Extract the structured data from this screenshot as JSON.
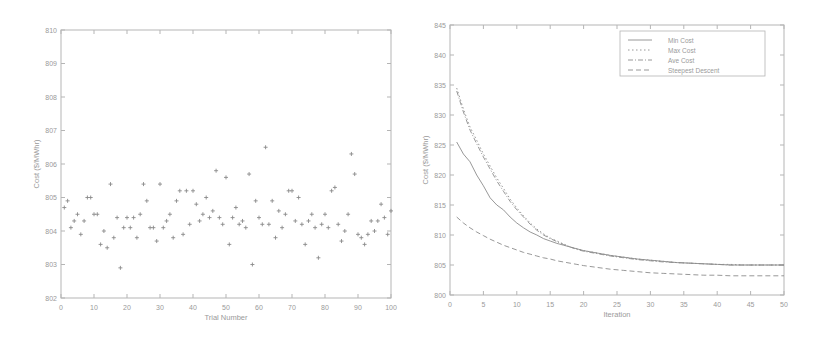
{
  "chart_data": [
    {
      "type": "scatter",
      "title": "",
      "xlabel": "Trial Number",
      "ylabel": "Cost ($/MWhr)",
      "xlim": [
        0,
        100
      ],
      "ylim": [
        802,
        810
      ],
      "xticks": [
        0,
        10,
        20,
        30,
        40,
        50,
        60,
        70,
        80,
        90,
        100
      ],
      "yticks": [
        802,
        803,
        804,
        805,
        806,
        807,
        808,
        809,
        810
      ],
      "grid": false,
      "marker": "+",
      "x": [
        1,
        2,
        3,
        4,
        5,
        6,
        7,
        8,
        9,
        10,
        11,
        12,
        13,
        14,
        15,
        16,
        17,
        18,
        19,
        20,
        21,
        22,
        23,
        24,
        25,
        26,
        27,
        28,
        29,
        30,
        31,
        32,
        33,
        34,
        35,
        36,
        37,
        38,
        39,
        40,
        41,
        42,
        43,
        44,
        45,
        46,
        47,
        48,
        49,
        50,
        51,
        52,
        53,
        54,
        55,
        56,
        57,
        58,
        59,
        60,
        61,
        62,
        63,
        64,
        65,
        66,
        67,
        68,
        69,
        70,
        71,
        72,
        73,
        74,
        75,
        76,
        77,
        78,
        79,
        80,
        81,
        82,
        83,
        84,
        85,
        86,
        87,
        88,
        89,
        90,
        91,
        92,
        93,
        94,
        95,
        96,
        97,
        98,
        99,
        100
      ],
      "values": [
        804.7,
        804.9,
        804.1,
        804.3,
        804.5,
        803.9,
        804.3,
        805.0,
        805.0,
        804.5,
        804.5,
        803.6,
        804.0,
        803.5,
        805.4,
        803.8,
        804.4,
        802.9,
        804.1,
        804.4,
        804.1,
        804.4,
        803.8,
        804.5,
        805.4,
        804.9,
        804.1,
        804.1,
        803.7,
        805.4,
        804.1,
        804.3,
        804.5,
        803.8,
        804.9,
        805.2,
        803.9,
        805.2,
        804.2,
        805.2,
        804.8,
        804.3,
        804.5,
        805.0,
        804.4,
        804.6,
        805.8,
        804.4,
        804.2,
        805.6,
        803.6,
        804.4,
        804.7,
        804.2,
        804.3,
        804.1,
        805.7,
        803.0,
        804.9,
        804.4,
        804.2,
        806.5,
        804.2,
        804.9,
        803.8,
        804.6,
        804.1,
        804.5,
        805.2,
        805.2,
        804.3,
        805.0,
        804.2,
        803.6,
        804.3,
        804.5,
        804.1,
        803.2,
        804.2,
        804.5,
        804.1,
        805.2,
        805.3,
        804.2,
        803.7,
        804.0,
        804.5,
        806.3,
        805.7,
        803.9,
        803.8,
        803.6,
        803.9,
        804.3,
        804.0,
        804.3,
        804.8,
        804.4,
        803.9,
        804.6
      ]
    },
    {
      "type": "line",
      "title": "",
      "xlabel": "Iteration",
      "ylabel": "Cost ($/MWhr)",
      "xlim": [
        0,
        50
      ],
      "ylim": [
        800,
        845
      ],
      "xticks": [
        0,
        5,
        10,
        15,
        20,
        25,
        30,
        35,
        40,
        45,
        50
      ],
      "yticks": [
        800,
        805,
        810,
        815,
        820,
        825,
        830,
        835,
        840,
        845
      ],
      "grid": false,
      "legend_position": "upper right",
      "x": [
        1,
        2,
        3,
        4,
        5,
        6,
        7,
        8,
        9,
        10,
        11,
        12,
        13,
        14,
        15,
        16,
        17,
        18,
        19,
        20,
        22,
        24,
        26,
        28,
        30,
        32,
        34,
        36,
        38,
        40,
        42,
        44,
        46,
        48,
        50
      ],
      "series": [
        {
          "name": "Min Cost",
          "style": "solid",
          "values": [
            825.5,
            823.5,
            822.2,
            820.0,
            818.2,
            816.2,
            815.0,
            814.2,
            813.0,
            812.0,
            811.2,
            810.5,
            810.0,
            809.4,
            809.0,
            808.6,
            808.3,
            808.0,
            807.7,
            807.4,
            807.0,
            806.6,
            806.3,
            806.0,
            805.8,
            805.6,
            805.4,
            805.3,
            805.2,
            805.1,
            805.0,
            805.0,
            805.0,
            805.0,
            805.0
          ]
        },
        {
          "name": "Max Cost",
          "style": "dotted",
          "values": [
            834.5,
            831.0,
            828.0,
            825.8,
            823.5,
            821.5,
            819.5,
            817.8,
            816.0,
            814.5,
            813.2,
            812.0,
            811.0,
            810.2,
            809.5,
            809.0,
            808.5,
            808.0,
            807.7,
            807.4,
            807.0,
            806.6,
            806.3,
            806.0,
            805.8,
            805.6,
            805.4,
            805.3,
            805.2,
            805.1,
            805.1,
            805.0,
            805.0,
            805.0,
            805.0
          ]
        },
        {
          "name": "Ave Cost",
          "style": "dashdot",
          "values": [
            834.0,
            830.5,
            827.5,
            825.2,
            823.0,
            821.0,
            819.0,
            817.3,
            815.6,
            814.2,
            813.0,
            811.8,
            810.8,
            810.0,
            809.4,
            808.9,
            808.4,
            808.0,
            807.6,
            807.3,
            806.9,
            806.5,
            806.2,
            805.9,
            805.7,
            805.5,
            805.4,
            805.3,
            805.2,
            805.1,
            805.0,
            805.0,
            805.0,
            805.0,
            805.0
          ]
        },
        {
          "name": "Steepest Descent",
          "style": "dashed",
          "values": [
            813.0,
            812.0,
            811.2,
            810.5,
            809.9,
            809.3,
            808.8,
            808.3,
            807.9,
            807.5,
            807.1,
            806.8,
            806.5,
            806.2,
            806.0,
            805.7,
            805.5,
            805.3,
            805.1,
            804.9,
            804.6,
            804.3,
            804.1,
            803.9,
            803.7,
            803.6,
            803.5,
            803.4,
            803.3,
            803.3,
            803.2,
            803.2,
            803.2,
            803.2,
            803.2
          ]
        }
      ]
    }
  ]
}
